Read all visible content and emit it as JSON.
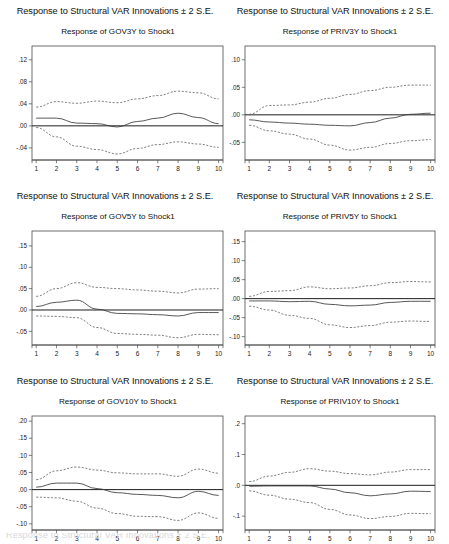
{
  "figure": {
    "panel_super_title": "Response to Structural VAR Innovations ± 2 S.E.",
    "shock_label": "Shock1",
    "bottom_cutoff_text": "Response to Structural VAR Innovations ± 2 S.E."
  },
  "colors": {
    "frame": "#4a4a4a",
    "zero_line": "#1e1e1e",
    "response_line": "#3a3a3a",
    "confidence_band": "#555555",
    "background": "#ffffff"
  },
  "chart_data": [
    {
      "id": "gov3y",
      "type": "line",
      "title": "Response of GOV3Y to Shock1",
      "supertitle": "Response to Structural VAR Innovations ± 2 S.E.",
      "xlabel": "",
      "ylabel": "",
      "x": [
        1,
        2,
        3,
        4,
        5,
        6,
        7,
        8,
        9,
        10
      ],
      "xticklabels": [
        "1",
        "2",
        "3",
        "4",
        "5",
        "6",
        "7",
        "8",
        "9",
        "10"
      ],
      "yticks": [
        0.12,
        0.08,
        0.04,
        0.0,
        -0.04
      ],
      "yticklabels": [
        ".12",
        ".08",
        ".04",
        ".00",
        "-.04"
      ],
      "ylim": [
        -0.062,
        0.145
      ],
      "grid": false,
      "legend": "none",
      "series": [
        {
          "name": "Upper 2 S.E.",
          "style": "dashed",
          "values": [
            0.034,
            0.044,
            0.041,
            0.045,
            0.042,
            0.049,
            0.055,
            0.063,
            0.06,
            0.049
          ]
        },
        {
          "name": "Response",
          "style": "solid",
          "values": [
            0.014,
            0.014,
            0.005,
            0.004,
            -0.002,
            0.008,
            0.014,
            0.023,
            0.015,
            0.004
          ]
        },
        {
          "name": "Lower 2 S.E.",
          "style": "dashed",
          "values": [
            -0.003,
            -0.02,
            -0.037,
            -0.043,
            -0.051,
            -0.041,
            -0.034,
            -0.029,
            -0.033,
            -0.039
          ]
        }
      ]
    },
    {
      "id": "priv3y",
      "type": "line",
      "title": "Response of PRIV3Y to Shock1",
      "supertitle": "Response to Structural VAR Innovations ± 2 S.E.",
      "xlabel": "",
      "ylabel": "",
      "x": [
        1,
        2,
        3,
        4,
        5,
        6,
        7,
        8,
        9,
        10
      ],
      "xticklabels": [
        "1",
        "2",
        "3",
        "4",
        "5",
        "6",
        "7",
        "8",
        "9",
        "10"
      ],
      "yticks": [
        0.1,
        0.05,
        0.0,
        -0.05
      ],
      "yticklabels": [
        ".10",
        ".05",
        ".00",
        "-.05"
      ],
      "ylim": [
        -0.082,
        0.125
      ],
      "grid": false,
      "legend": "none",
      "series": [
        {
          "name": "Upper 2 S.E.",
          "style": "dashed",
          "values": [
            0.001,
            0.017,
            0.018,
            0.023,
            0.03,
            0.037,
            0.044,
            0.05,
            0.054,
            0.054
          ]
        },
        {
          "name": "Response",
          "style": "solid",
          "values": [
            -0.009,
            -0.013,
            -0.015,
            -0.017,
            -0.019,
            -0.02,
            -0.014,
            -0.006,
            0.001,
            0.003
          ]
        },
        {
          "name": "Lower 2 S.E.",
          "style": "dashed",
          "values": [
            -0.019,
            -0.029,
            -0.035,
            -0.044,
            -0.055,
            -0.064,
            -0.059,
            -0.052,
            -0.047,
            -0.045
          ]
        }
      ]
    },
    {
      "id": "gov5y",
      "type": "line",
      "title": "Response of GOV5Y to Shock1",
      "supertitle": "Response to Structural VAR Innovations ± 2 S.E.",
      "xlabel": "",
      "ylabel": "",
      "x": [
        1,
        2,
        3,
        4,
        5,
        6,
        7,
        8,
        9,
        10
      ],
      "xticklabels": [
        "1",
        "2",
        "3",
        "4",
        "5",
        "6",
        "7",
        "8",
        "9",
        "10"
      ],
      "yticks": [
        0.15,
        0.1,
        0.05,
        0.0,
        -0.05
      ],
      "yticklabels": [
        ".15",
        ".10",
        ".05",
        ".00",
        "-.05"
      ],
      "ylim": [
        -0.082,
        0.185
      ],
      "grid": false,
      "legend": "none",
      "series": [
        {
          "name": "Upper 2 S.E.",
          "style": "dashed",
          "values": [
            0.032,
            0.05,
            0.064,
            0.053,
            0.05,
            0.047,
            0.044,
            0.04,
            0.049,
            0.05
          ]
        },
        {
          "name": "Response",
          "style": "solid",
          "values": [
            0.008,
            0.018,
            0.023,
            0.002,
            -0.008,
            -0.009,
            -0.011,
            -0.014,
            -0.006,
            -0.006
          ]
        },
        {
          "name": "Lower 2 S.E.",
          "style": "dashed",
          "values": [
            -0.014,
            -0.015,
            -0.018,
            -0.041,
            -0.055,
            -0.057,
            -0.059,
            -0.065,
            -0.057,
            -0.058
          ]
        }
      ]
    },
    {
      "id": "priv5y",
      "type": "line",
      "title": "Response of PRIV5Y to Shock1",
      "supertitle": "Response to Structural VAR Innovations ± 2 S.E.",
      "xlabel": "",
      "ylabel": "",
      "x": [
        1,
        2,
        3,
        4,
        5,
        6,
        7,
        8,
        9,
        10
      ],
      "xticklabels": [
        "1",
        "2",
        "3",
        "4",
        "5",
        "6",
        "7",
        "8",
        "9",
        "10"
      ],
      "yticks": [
        0.15,
        0.1,
        0.05,
        0.0,
        -0.05,
        -0.1
      ],
      "yticklabels": [
        ".15",
        ".10",
        ".05",
        ".00",
        "-.05",
        "-.10"
      ],
      "ylim": [
        -0.122,
        0.178
      ],
      "grid": false,
      "legend": "none",
      "series": [
        {
          "name": "Upper 2 S.E.",
          "style": "dashed",
          "values": [
            0.006,
            0.019,
            0.021,
            0.031,
            0.026,
            0.028,
            0.034,
            0.042,
            0.045,
            0.044
          ]
        },
        {
          "name": "Response",
          "style": "solid",
          "values": [
            -0.006,
            -0.006,
            -0.008,
            -0.007,
            -0.015,
            -0.019,
            -0.017,
            -0.01,
            -0.007,
            -0.007
          ]
        },
        {
          "name": "Lower 2 S.E.",
          "style": "dashed",
          "values": [
            -0.02,
            -0.03,
            -0.044,
            -0.052,
            -0.069,
            -0.076,
            -0.071,
            -0.062,
            -0.059,
            -0.06
          ]
        }
      ]
    },
    {
      "id": "gov10y",
      "type": "line",
      "title": "Response of GOV10Y to Shock1",
      "supertitle": "Response to Structural VAR Innovations ± 2 S.E.",
      "xlabel": "",
      "ylabel": "",
      "x": [
        1,
        2,
        3,
        4,
        5,
        6,
        7,
        8,
        9,
        10
      ],
      "xticklabels": [
        "1",
        "2",
        "3",
        "4",
        "5",
        "6",
        "7",
        "8",
        "9",
        "10"
      ],
      "yticks": [
        0.2,
        0.15,
        0.1,
        0.05,
        0.0,
        -0.05,
        -0.1
      ],
      "yticklabels": [
        ".20",
        ".15",
        ".10",
        ".05",
        ".00",
        "-.05",
        "-.10"
      ],
      "ylim": [
        -0.118,
        0.215
      ],
      "grid": false,
      "legend": "none",
      "series": [
        {
          "name": "Upper 2 S.E.",
          "style": "dashed",
          "values": [
            0.029,
            0.055,
            0.066,
            0.057,
            0.049,
            0.046,
            0.046,
            0.039,
            0.06,
            0.048
          ]
        },
        {
          "name": "Response",
          "style": "solid",
          "values": [
            0.007,
            0.019,
            0.019,
            0.003,
            -0.009,
            -0.014,
            -0.017,
            -0.024,
            -0.005,
            -0.017
          ]
        },
        {
          "name": "Lower 2 S.E.",
          "style": "dashed",
          "values": [
            -0.022,
            -0.024,
            -0.034,
            -0.054,
            -0.07,
            -0.078,
            -0.079,
            -0.09,
            -0.068,
            -0.084
          ]
        }
      ]
    },
    {
      "id": "priv10y",
      "type": "line",
      "title": "Response of PRIV10Y to Shock1",
      "supertitle": "Response to Structural VAR Innovations ± 2 S.E.",
      "xlabel": "",
      "ylabel": "",
      "x": [
        1,
        2,
        3,
        4,
        5,
        6,
        7,
        8,
        9,
        10
      ],
      "xticklabels": [
        "1",
        "2",
        "3",
        "4",
        "5",
        "6",
        "7",
        "8",
        "9",
        "10"
      ],
      "yticks": [
        0.2,
        0.1,
        0.0,
        -0.1
      ],
      "yticklabels": [
        ".2",
        ".1",
        ".0",
        "-.1"
      ],
      "ylim": [
        -0.145,
        0.225
      ],
      "grid": false,
      "legend": "none",
      "series": [
        {
          "name": "Upper 2 S.E.",
          "style": "dashed",
          "values": [
            0.012,
            0.03,
            0.042,
            0.054,
            0.046,
            0.038,
            0.034,
            0.043,
            0.051,
            0.051
          ]
        },
        {
          "name": "Response",
          "style": "solid",
          "values": [
            -0.003,
            -0.002,
            -0.002,
            -0.002,
            -0.012,
            -0.024,
            -0.034,
            -0.028,
            -0.019,
            -0.02
          ]
        },
        {
          "name": "Lower 2 S.E.",
          "style": "dashed",
          "values": [
            -0.018,
            -0.032,
            -0.045,
            -0.056,
            -0.078,
            -0.096,
            -0.108,
            -0.101,
            -0.091,
            -0.092
          ]
        }
      ]
    }
  ]
}
